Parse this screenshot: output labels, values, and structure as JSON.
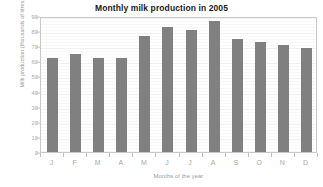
{
  "chart_data": {
    "type": "bar",
    "title": "Monthly milk production in 2005",
    "xlabel": "Months of the year",
    "ylabel": "Milk production (thousands of litres)",
    "categories": [
      "J",
      "F",
      "M",
      "A",
      "M",
      "J",
      "J",
      "A",
      "S",
      "O",
      "N",
      "D"
    ],
    "values": [
      62,
      65,
      62,
      62,
      77,
      83,
      81,
      87,
      75,
      73,
      71,
      69
    ],
    "ylim": [
      0,
      90
    ],
    "ytick_labels": [
      "0",
      "10",
      "20",
      "30",
      "40",
      "50",
      "60",
      "70",
      "80",
      "90"
    ],
    "ytick_values": [
      0,
      10,
      20,
      30,
      40,
      50,
      60,
      70,
      80,
      90
    ],
    "grid": true,
    "legend": false,
    "bar_color": "#808080",
    "axis_color": "#c9c9c9",
    "tick_label_color": "#a8a8a8",
    "axis_title_color": "#9a9a9a",
    "title_color": "#1a1a1a",
    "plot_background": "#ffffff",
    "gridline_color": "#f1f1f1"
  }
}
